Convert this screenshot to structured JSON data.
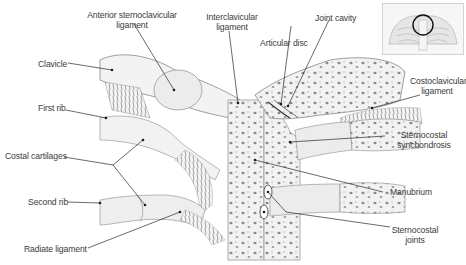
{
  "figure": {
    "labels": {
      "anterior_sternoclavicular_ligament": "Anterior sternoclavicular\nligament",
      "interclavicular_ligament": "Interclavicular\nligament",
      "joint_cavity": "Joint cavity",
      "articular_disc": "Articular disc",
      "clavicle": "Clavicle",
      "first_rib": "First rib",
      "costoclavicular_ligament": "Costoclavicular\nligament",
      "costal_cartilages": "Costal cartilages",
      "sternocostal_synchondrosis": "Sternocostal\nsynchondrosis",
      "manubrium": "Manubrium",
      "second_rib": "Second rib",
      "sternocostal_joints": "Sternocostal\njoints",
      "radiate_ligament": "Radiate ligament"
    },
    "inset": {
      "description": "Thorax overview with circled sternoclavicular region"
    },
    "colors": {
      "line": "#2a2a2a",
      "bone": "#efefef",
      "shade": "#bdbdbd",
      "text": "#3a3a3a"
    }
  }
}
